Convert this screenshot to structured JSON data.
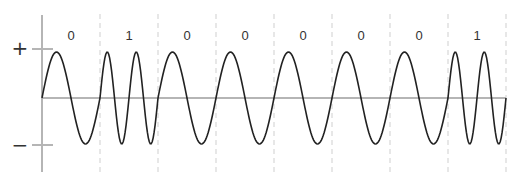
{
  "diagram": {
    "type": "FSK waveform (frequency-shift keying)",
    "bits": [
      "0",
      "1",
      "0",
      "0",
      "0",
      "0",
      "0",
      "1"
    ],
    "cycles_per_bit": {
      "0": 1,
      "1": 2
    },
    "y_axis": {
      "positive_label": "+",
      "negative_label": "−"
    },
    "colors": {
      "waveform": "#222222",
      "axis": "#b5b5b5",
      "divider": "#cfcfcf",
      "text": "#333333"
    }
  }
}
